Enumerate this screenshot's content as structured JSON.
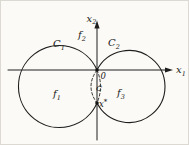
{
  "colors": {
    "ink": "#1e1e1e",
    "paper": "#fbfaf6"
  },
  "axis": {
    "x1": {
      "base": "x",
      "sub": "1"
    },
    "x2": {
      "base": "x",
      "sub": "2"
    }
  },
  "sets": {
    "c1": {
      "base": "C",
      "sub": "1"
    },
    "c2": {
      "base": "C",
      "sub": "2"
    },
    "c_tilde": "C̃"
  },
  "functions": {
    "f1": {
      "base": "f",
      "sub": "1"
    },
    "f2": {
      "base": "f",
      "sub": "2"
    },
    "f3": {
      "base": "f",
      "sub": "3"
    }
  },
  "points": {
    "origin": "0",
    "x_star": {
      "base": "x",
      "sup": "*"
    }
  }
}
